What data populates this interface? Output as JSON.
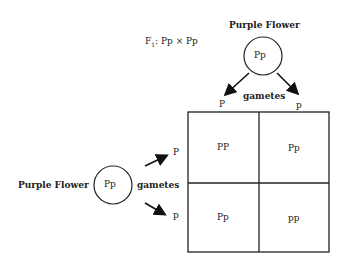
{
  "cross_label_prefix": "F",
  "cross_label_sub": "1",
  "cross_label_rest": ": Pp × Pp",
  "top_parent": {
    "label": "Purple Flower",
    "genotype": "Pp",
    "gametes_label": "gametes",
    "gametes": [
      "P",
      "p"
    ]
  },
  "left_parent": {
    "label": "Purple Flower",
    "genotype": "Pp",
    "gametes_label": "gametes",
    "gametes": [
      "P",
      "p"
    ]
  },
  "punnett": {
    "cells": [
      [
        "PP",
        "Pp"
      ],
      [
        "Pp",
        "pp"
      ]
    ]
  },
  "colors": {
    "line": "#222222",
    "background": "#ffffff"
  }
}
